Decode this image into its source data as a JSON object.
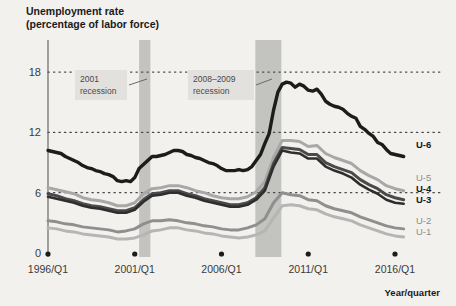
{
  "chart_data": {
    "type": "line",
    "title": "Unemployment rate",
    "subtitle": "(percentage of labor force)",
    "xlabel": "Year/quarter",
    "ylabel": "",
    "xlim": [
      1996,
      2016.75
    ],
    "ylim": [
      0,
      19.5
    ],
    "grid": "horizontal-dotted",
    "legend_position": "right-inline",
    "yticks": [
      "0",
      "6",
      "12",
      "18"
    ],
    "ytick_values": [
      0,
      6,
      12,
      18
    ],
    "xticks": [
      "1996/Q1",
      "2001/Q1",
      "2006/Q1",
      "2011/Q1",
      "2016/Q1"
    ],
    "xtick_values": [
      1996,
      2001,
      2006,
      2011,
      2016
    ],
    "annotations": [
      {
        "name": "recession-2001",
        "line1": "2001",
        "line2": "recession",
        "band_start": 2001.25,
        "band_end": 2001.9
      },
      {
        "name": "recession-2008-2009",
        "line1": "2008–2009",
        "line2": "recession",
        "band_start": 2007.95,
        "band_end": 2009.45
      }
    ],
    "series": [
      {
        "name": "U-6",
        "label": "U-6",
        "color": "#1c1c1c",
        "width": 3.4,
        "bold_label": true,
        "x": [
          1996,
          1996.25,
          1996.5,
          1996.75,
          1997,
          1997.25,
          1997.5,
          1997.75,
          1998,
          1998.25,
          1998.5,
          1998.75,
          1999,
          1999.25,
          1999.5,
          1999.75,
          2000,
          2000.25,
          2000.5,
          2000.75,
          2001,
          2001.25,
          2001.5,
          2001.75,
          2002,
          2002.25,
          2002.5,
          2002.75,
          2003,
          2003.25,
          2003.5,
          2003.75,
          2004,
          2004.25,
          2004.5,
          2004.75,
          2005,
          2005.25,
          2005.5,
          2005.75,
          2006,
          2006.25,
          2006.5,
          2006.75,
          2007,
          2007.25,
          2007.5,
          2007.75,
          2008,
          2008.25,
          2008.5,
          2008.75,
          2009,
          2009.25,
          2009.5,
          2009.75,
          2010,
          2010.25,
          2010.5,
          2010.75,
          2011,
          2011.25,
          2011.5,
          2011.75,
          2012,
          2012.25,
          2012.5,
          2012.75,
          2013,
          2013.25,
          2013.5,
          2013.75,
          2014,
          2014.25,
          2014.5,
          2014.75,
          2015,
          2015.25,
          2015.5,
          2015.75,
          2016,
          2016.25,
          2016.5
        ],
        "y": [
          10.2,
          10.1,
          10.0,
          9.9,
          9.6,
          9.4,
          9.2,
          9.0,
          8.7,
          8.5,
          8.4,
          8.2,
          8.1,
          7.9,
          7.8,
          7.6,
          7.2,
          7.1,
          7.2,
          7.1,
          7.5,
          8.4,
          8.8,
          9.2,
          9.6,
          9.6,
          9.7,
          9.8,
          10.0,
          10.2,
          10.2,
          10.1,
          9.8,
          9.7,
          9.5,
          9.4,
          9.2,
          9.0,
          8.9,
          8.7,
          8.4,
          8.2,
          8.2,
          8.2,
          8.3,
          8.2,
          8.3,
          8.6,
          9.2,
          9.8,
          10.9,
          11.9,
          14.2,
          16.0,
          16.8,
          17.0,
          16.9,
          16.5,
          16.8,
          16.6,
          16.2,
          16.1,
          16.3,
          15.8,
          15.1,
          14.8,
          14.6,
          14.5,
          14.3,
          13.9,
          13.6,
          13.4,
          12.6,
          12.3,
          11.9,
          11.6,
          11.0,
          10.8,
          10.3,
          9.9,
          9.8,
          9.7,
          9.6
        ]
      },
      {
        "name": "U-5",
        "label": "U-5",
        "color": "#a8a8a8",
        "width": 3.0,
        "bold_label": false,
        "x": [
          1996,
          1996.5,
          1997,
          1997.5,
          1998,
          1998.5,
          1999,
          1999.5,
          2000,
          2000.5,
          2001,
          2001.5,
          2002,
          2002.5,
          2003,
          2003.5,
          2004,
          2004.5,
          2005,
          2005.5,
          2006,
          2006.5,
          2007,
          2007.5,
          2008,
          2008.5,
          2009,
          2009.5,
          2010,
          2010.5,
          2011,
          2011.5,
          2012,
          2012.5,
          2013,
          2013.5,
          2014,
          2014.5,
          2015,
          2015.5,
          2016,
          2016.5
        ],
        "y": [
          6.5,
          6.3,
          6.1,
          5.9,
          5.5,
          5.3,
          5.2,
          5.0,
          4.7,
          4.7,
          5.0,
          5.9,
          6.4,
          6.5,
          6.7,
          6.7,
          6.5,
          6.2,
          6.0,
          5.7,
          5.5,
          5.4,
          5.4,
          5.6,
          6.1,
          7.1,
          9.5,
          11.2,
          11.2,
          11.1,
          10.6,
          10.7,
          9.9,
          9.5,
          9.2,
          8.9,
          8.2,
          7.7,
          7.3,
          6.7,
          6.4,
          6.2
        ]
      },
      {
        "name": "U-4",
        "label": "U-4",
        "color": "#4a4a4a",
        "width": 3.0,
        "bold_label": true,
        "x": [
          1996,
          1996.5,
          1997,
          1997.5,
          1998,
          1998.5,
          1999,
          1999.5,
          2000,
          2000.5,
          2001,
          2001.5,
          2002,
          2002.5,
          2003,
          2003.5,
          2004,
          2004.5,
          2005,
          2005.5,
          2006,
          2006.5,
          2007,
          2007.5,
          2008,
          2008.5,
          2009,
          2009.5,
          2010,
          2010.5,
          2011,
          2011.5,
          2012,
          2012.5,
          2013,
          2013.5,
          2014,
          2014.5,
          2015,
          2015.5,
          2016,
          2016.5
        ],
        "y": [
          5.9,
          5.7,
          5.4,
          5.2,
          4.9,
          4.7,
          4.6,
          4.4,
          4.2,
          4.2,
          4.5,
          5.3,
          5.9,
          6.0,
          6.2,
          6.2,
          5.9,
          5.7,
          5.4,
          5.2,
          5.0,
          4.8,
          4.8,
          5.0,
          5.5,
          6.5,
          8.9,
          10.5,
          10.4,
          10.3,
          9.8,
          9.8,
          9.0,
          8.6,
          8.3,
          8.0,
          7.3,
          6.8,
          6.4,
          5.8,
          5.5,
          5.3
        ]
      },
      {
        "name": "U-3",
        "label": "U-3",
        "color": "#2e2e2e",
        "width": 2.6,
        "bold_label": true,
        "x": [
          1996,
          1996.5,
          1997,
          1997.5,
          1998,
          1998.5,
          1999,
          1999.5,
          2000,
          2000.5,
          2001,
          2001.5,
          2002,
          2002.5,
          2003,
          2003.5,
          2004,
          2004.5,
          2005,
          2005.5,
          2006,
          2006.5,
          2007,
          2007.5,
          2008,
          2008.5,
          2009,
          2009.5,
          2010,
          2010.5,
          2011,
          2011.5,
          2012,
          2012.5,
          2013,
          2013.5,
          2014,
          2014.5,
          2015,
          2015.5,
          2016,
          2016.5
        ],
        "y": [
          5.6,
          5.4,
          5.2,
          5.0,
          4.7,
          4.5,
          4.4,
          4.2,
          4.0,
          4.0,
          4.3,
          5.1,
          5.7,
          5.8,
          6.0,
          6.0,
          5.7,
          5.5,
          5.2,
          5.0,
          4.8,
          4.6,
          4.6,
          4.8,
          5.3,
          6.2,
          8.6,
          10.2,
          10.0,
          9.9,
          9.4,
          9.4,
          8.6,
          8.2,
          7.9,
          7.5,
          6.8,
          6.3,
          5.9,
          5.3,
          5.0,
          4.9
        ]
      },
      {
        "name": "U-2",
        "label": "U-2",
        "color": "#8f8f8f",
        "width": 3.0,
        "bold_label": false,
        "x": [
          1996,
          1996.5,
          1997,
          1997.5,
          1998,
          1998.5,
          1999,
          1999.5,
          2000,
          2000.5,
          2001,
          2001.5,
          2002,
          2002.5,
          2003,
          2003.5,
          2004,
          2004.5,
          2005,
          2005.5,
          2006,
          2006.5,
          2007,
          2007.5,
          2008,
          2008.5,
          2009,
          2009.5,
          2010,
          2010.5,
          2011,
          2011.5,
          2012,
          2012.5,
          2013,
          2013.5,
          2014,
          2014.5,
          2015,
          2015.5,
          2016,
          2016.5
        ],
        "y": [
          3.2,
          3.1,
          2.9,
          2.8,
          2.6,
          2.5,
          2.4,
          2.3,
          2.1,
          2.2,
          2.4,
          2.9,
          3.2,
          3.2,
          3.3,
          3.2,
          3.0,
          2.9,
          2.7,
          2.6,
          2.4,
          2.3,
          2.3,
          2.5,
          2.8,
          3.4,
          5.0,
          6.0,
          5.8,
          5.7,
          5.3,
          5.2,
          4.7,
          4.4,
          4.2,
          4.0,
          3.6,
          3.3,
          3.0,
          2.7,
          2.5,
          2.4
        ]
      },
      {
        "name": "U-1",
        "label": "U-1",
        "color": "#b5b5b5",
        "width": 3.0,
        "bold_label": false,
        "x": [
          1996,
          1996.5,
          1997,
          1997.5,
          1998,
          1998.5,
          1999,
          1999.5,
          2000,
          2000.5,
          2001,
          2001.5,
          2002,
          2002.5,
          2003,
          2003.5,
          2004,
          2004.5,
          2005,
          2005.5,
          2006,
          2006.5,
          2007,
          2007.5,
          2008,
          2008.5,
          2009,
          2009.5,
          2010,
          2010.5,
          2011,
          2011.5,
          2012,
          2012.5,
          2013,
          2013.5,
          2014,
          2014.5,
          2015,
          2015.5,
          2016,
          2016.5
        ],
        "y": [
          2.5,
          2.4,
          2.2,
          2.1,
          1.9,
          1.8,
          1.7,
          1.6,
          1.4,
          1.4,
          1.5,
          1.8,
          2.2,
          2.3,
          2.5,
          2.5,
          2.3,
          2.2,
          2.0,
          1.9,
          1.7,
          1.6,
          1.5,
          1.6,
          1.8,
          2.2,
          3.5,
          4.7,
          4.8,
          4.7,
          4.4,
          4.3,
          3.9,
          3.6,
          3.4,
          3.2,
          2.8,
          2.5,
          2.2,
          1.9,
          1.7,
          1.6
        ]
      }
    ]
  },
  "colors": {
    "background": "#f2f1ee",
    "recession_band": "#c3c3c0",
    "annotation_box": "#e2e1de",
    "axis": "#4a4a4a",
    "grid_dot": "#4a4a4a"
  }
}
